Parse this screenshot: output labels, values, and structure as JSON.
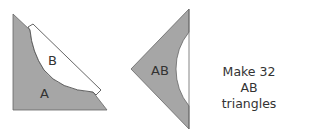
{
  "diagram": {
    "left_piece": {
      "label_a": "A",
      "label_b": "B"
    },
    "right_piece": {
      "label": "AB"
    },
    "instruction": {
      "line1": "Make 32",
      "line2": "AB triangles"
    },
    "colors": {
      "fill": "#a6a6a6",
      "stroke": "#555555",
      "background": "#ffffff"
    }
  }
}
